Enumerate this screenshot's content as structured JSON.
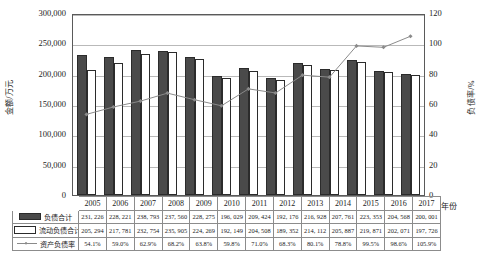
{
  "chart_data": {
    "type": "bar",
    "title": "",
    "xlabel": "年份",
    "ylabel": "金额/万元",
    "y2label": "负债率/%",
    "categories": [
      "2005",
      "2006",
      "2007",
      "2008",
      "2009",
      "2010",
      "2011",
      "2012",
      "2013",
      "2014",
      "2015",
      "2016",
      "2017"
    ],
    "ylim": [
      0,
      300000
    ],
    "y2lim": [
      0,
      120
    ],
    "yticks": [
      "0",
      "50,000",
      "100,000",
      "150,000",
      "200,000",
      "250,000",
      "300,000"
    ],
    "ytick_values": [
      0,
      50000,
      100000,
      150000,
      200000,
      250000,
      300000
    ],
    "y2ticks": [
      "0",
      "20",
      "40",
      "60",
      "80",
      "100",
      "120"
    ],
    "y2tick_values": [
      0,
      20,
      40,
      60,
      80,
      100,
      120
    ],
    "grid": true,
    "legend_position": "table-left",
    "series": [
      {
        "name": "负债合计",
        "type": "bar",
        "axis": "left",
        "marker": "filled-bar",
        "values": [
          231226,
          228221,
          238793,
          237560,
          228275,
          196029,
          209424,
          192176,
          216928,
          207761,
          223353,
          204568,
          200001
        ],
        "labels": [
          "231, 226",
          "228, 221",
          "238, 793",
          "237, 560",
          "228, 275",
          "196, 029",
          "209, 424",
          "192, 176",
          "216, 928",
          "207, 761",
          "223, 353",
          "204, 568",
          "200, 001"
        ]
      },
      {
        "name": "流动负债合计",
        "type": "bar",
        "axis": "left",
        "marker": "hollow-bar",
        "values": [
          205294,
          217781,
          232754,
          235905,
          224269,
          192149,
          204508,
          189352,
          214112,
          205887,
          219871,
          202071,
          197726
        ],
        "labels": [
          "205, 294",
          "217, 781",
          "232, 754",
          "235, 905",
          "224, 269",
          "192, 149",
          "204, 508",
          "189, 352",
          "214, 112",
          "205, 887",
          "219, 871",
          "202, 071",
          "197, 726"
        ]
      },
      {
        "name": "资产负债率",
        "type": "line",
        "axis": "right",
        "marker": "diamond",
        "values": [
          54.1,
          59.0,
          62.9,
          68.2,
          63.8,
          59.8,
          71.0,
          68.3,
          80.1,
          78.8,
          99.5,
          98.6,
          105.9
        ],
        "labels": [
          "54.1%",
          "59.0%",
          "62.9%",
          "68.2%",
          "63.8%",
          "59.8%",
          "71.0%",
          "68.3%",
          "80.1%",
          "78.8%",
          "99.5%",
          "98.6%",
          "105.9%"
        ]
      }
    ],
    "colors": {
      "total_liabilities_bar": "#4a4a4a",
      "current_liabilities_bar": "#ffffff",
      "ratio_line": "#8a8a8a",
      "axis": "#5a5a5a",
      "gridline": "#b9b9b9"
    }
  }
}
